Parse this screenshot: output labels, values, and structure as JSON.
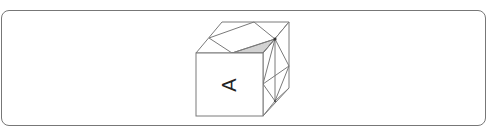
{
  "diagram": {
    "type": "isometric-cube-net-question",
    "front_face_label": "A",
    "front_face_label_rotation_deg": -90,
    "colors": {
      "border": "#777777",
      "line": "#7a7a7a",
      "shaded_region": "#d2d2d2",
      "node": "#333333",
      "background": "#ffffff"
    },
    "faces": {
      "front": {
        "label": "A",
        "pattern": "blank"
      },
      "top": {
        "pattern": "triangulated with one shaded triangle"
      },
      "right": {
        "pattern": "triangulated with two nodes"
      }
    }
  }
}
